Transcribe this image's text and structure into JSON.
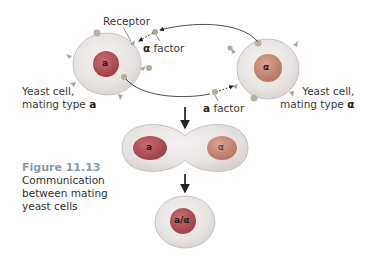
{
  "diagram": {
    "labels": {
      "receptor": "Receptor",
      "alpha_factor_symbol": "α",
      "alpha_factor_text": " factor",
      "a_factor_symbol": "a",
      "a_factor_text": " factor",
      "yeast_a_line1": "Yeast cell,",
      "yeast_a_line2": "mating type ",
      "yeast_a_type": "a",
      "yeast_alpha_line1": "Yeast cell,",
      "yeast_alpha_line2": "mating type ",
      "yeast_alpha_type": "α"
    },
    "nuclei": {
      "cell_a": "a",
      "cell_alpha": "α",
      "fused_a": "a",
      "fused_alpha": "α",
      "diploid": "a/α"
    },
    "caption": {
      "figure": "Figure 11.13",
      "line1": "Communication",
      "line2": "between mating",
      "line3": "yeast cells"
    },
    "colors": {
      "cytoplasm": "#e9e6e4",
      "cell_edge": "#c9c3c1",
      "nucleus_a": "#b04e57",
      "nucleus_alpha": "#c98b78",
      "receptor": "#a8a6a0",
      "factor": "#a7b09a",
      "caption_fig": "#8a9aa8"
    }
  }
}
